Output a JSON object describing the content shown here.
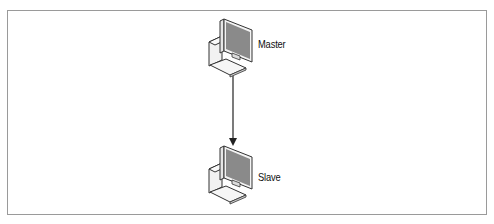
{
  "diagram": {
    "type": "replication-topology",
    "nodes": [
      {
        "id": "master",
        "label": "Master",
        "icon": "desktop-computer-icon"
      },
      {
        "id": "slave",
        "label": "Slave",
        "icon": "desktop-computer-icon"
      }
    ],
    "edges": [
      {
        "from": "master",
        "to": "slave",
        "style": "arrow"
      }
    ],
    "colors": {
      "frame": "#9a9a9a",
      "screen": "#8a8a8a",
      "outline": "#333333",
      "arrow": "#222222"
    }
  }
}
